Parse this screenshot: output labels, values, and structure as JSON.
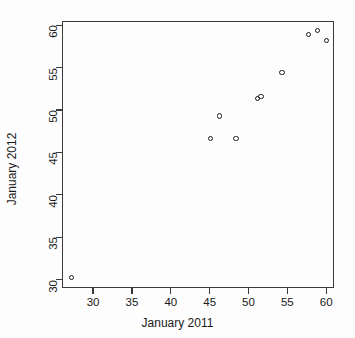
{
  "chart_data": {
    "type": "scatter",
    "title": "",
    "xlabel": "January 2011",
    "ylabel": "January 2012",
    "xlim": [
      26.0,
      61.0
    ],
    "ylim": [
      29.0,
      60.5
    ],
    "xticks": [
      30,
      35,
      40,
      45,
      50,
      55,
      60
    ],
    "yticks": [
      30,
      35,
      40,
      45,
      50,
      55,
      60
    ],
    "xticklabels": [
      "30",
      "35",
      "40",
      "45",
      "50",
      "55",
      "60"
    ],
    "yticklabels": [
      "30",
      "35",
      "40",
      "45",
      "50",
      "55",
      "60"
    ],
    "grid": false,
    "legend": null,
    "marker": "open-circle",
    "marker_color": "#1a1a1a",
    "background_color": "#fdfdfd",
    "axis_color": "#3a3a3a",
    "points": [
      {
        "x": 27.2,
        "y": 30.2
      },
      {
        "x": 45.1,
        "y": 46.6
      },
      {
        "x": 46.3,
        "y": 49.3
      },
      {
        "x": 48.4,
        "y": 46.6
      },
      {
        "x": 51.2,
        "y": 51.4
      },
      {
        "x": 51.6,
        "y": 51.6
      },
      {
        "x": 54.3,
        "y": 54.4
      },
      {
        "x": 57.7,
        "y": 58.9
      },
      {
        "x": 58.9,
        "y": 59.4
      },
      {
        "x": 60.0,
        "y": 58.2
      }
    ],
    "x": [
      27.2,
      45.1,
      46.3,
      48.4,
      51.2,
      51.6,
      54.3,
      57.7,
      58.9,
      60.0
    ],
    "y": [
      30.2,
      46.6,
      49.3,
      46.6,
      51.4,
      51.6,
      54.4,
      58.9,
      59.4,
      58.2
    ]
  }
}
